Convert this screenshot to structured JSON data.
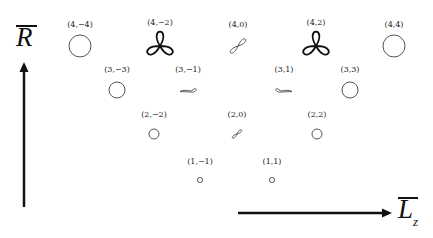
{
  "axes": {
    "vertical": {
      "label": "R",
      "overline": true,
      "direction": "up"
    },
    "horizontal": {
      "label": "L",
      "subscript": "z",
      "overline": true,
      "direction": "right"
    }
  },
  "states": [
    {
      "label": "(4,−4)",
      "shape": "circle",
      "x": 80,
      "y": 46,
      "size": 11
    },
    {
      "label": "(4,−2)",
      "shape": "trefoil",
      "x": 160,
      "y": 46,
      "size": 14
    },
    {
      "label": "(4,0)",
      "shape": "figure-eight",
      "x": 238,
      "y": 46,
      "size": 10
    },
    {
      "label": "(4,2)",
      "shape": "trefoil",
      "x": 316,
      "y": 46,
      "size": 14
    },
    {
      "label": "(4,4)",
      "shape": "circle",
      "x": 394,
      "y": 46,
      "size": 11
    },
    {
      "label": "(3,−3)",
      "shape": "circle",
      "x": 117,
      "y": 90,
      "size": 8
    },
    {
      "label": "(3,−1)",
      "shape": "tadpole",
      "x": 188,
      "y": 90,
      "size": 8
    },
    {
      "label": "(3,1)",
      "shape": "tadpole-mirrored",
      "x": 284,
      "y": 90,
      "size": 8
    },
    {
      "label": "(3,3)",
      "shape": "circle",
      "x": 350,
      "y": 90,
      "size": 8
    },
    {
      "label": "(2,−2)",
      "shape": "circle",
      "x": 154,
      "y": 134,
      "size": 5
    },
    {
      "label": "(2,0)",
      "shape": "figure-eight",
      "x": 237,
      "y": 134,
      "size": 6
    },
    {
      "label": "(2,2)",
      "shape": "circle",
      "x": 317,
      "y": 134,
      "size": 5
    },
    {
      "label": "(1,−1)",
      "shape": "circle",
      "x": 200,
      "y": 180,
      "size": 2.5
    },
    {
      "label": "(1,1)",
      "shape": "circle",
      "x": 272,
      "y": 180,
      "size": 2.5
    }
  ]
}
